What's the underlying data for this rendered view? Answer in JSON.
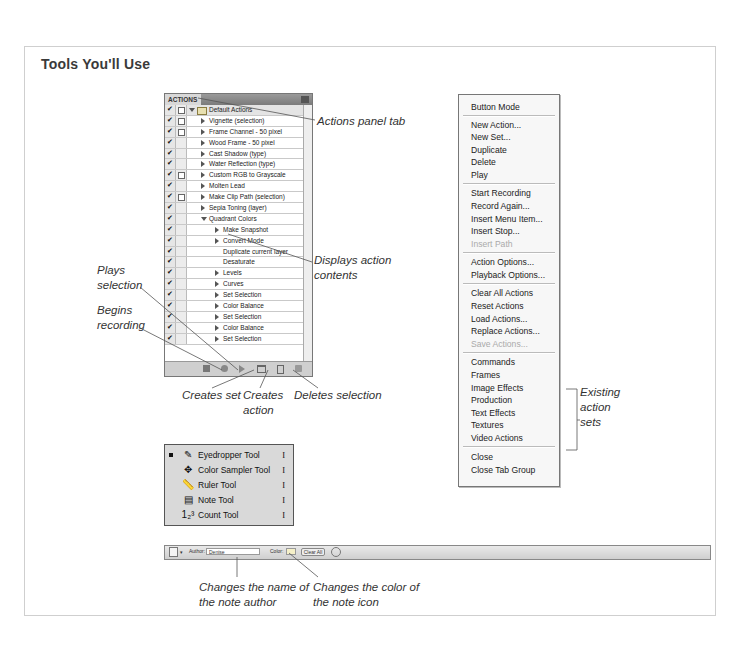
{
  "title": "Tools You'll Use",
  "actions_panel": {
    "tab_label": "ACTIONS",
    "rows": [
      {
        "label": "Default Actions",
        "type": "set",
        "expanded": true,
        "dialog": true
      },
      {
        "label": "Vignette (selection)",
        "type": "action",
        "dialog": true
      },
      {
        "label": "Frame Channel - 50 pixel",
        "type": "action",
        "dialog": true
      },
      {
        "label": "Wood Frame - 50 pixel",
        "type": "action",
        "dialog": false
      },
      {
        "label": "Cast Shadow (type)",
        "type": "action",
        "dialog": false
      },
      {
        "label": "Water Reflection (type)",
        "type": "action",
        "dialog": false
      },
      {
        "label": "Custom RGB to Grayscale",
        "type": "action",
        "dialog": true
      },
      {
        "label": "Molten Lead",
        "type": "action",
        "dialog": false
      },
      {
        "label": "Make Clip Path (selection)",
        "type": "action",
        "dialog": true
      },
      {
        "label": "Sepia Toning (layer)",
        "type": "action",
        "dialog": false
      },
      {
        "label": "Quadrant Colors",
        "type": "action",
        "expanded": true,
        "dialog": false
      },
      {
        "label": "Make Snapshot",
        "type": "step",
        "arrow": true
      },
      {
        "label": "Convert Mode",
        "type": "step",
        "arrow": true
      },
      {
        "label": "Duplicate current layer",
        "type": "step",
        "arrow": false
      },
      {
        "label": "Desaturate",
        "type": "step",
        "arrow": false
      },
      {
        "label": "Levels",
        "type": "step",
        "arrow": true
      },
      {
        "label": "Curves",
        "type": "step",
        "arrow": true
      },
      {
        "label": "Set Selection",
        "type": "step",
        "arrow": true
      },
      {
        "label": "Color Balance",
        "type": "step",
        "arrow": true
      },
      {
        "label": "Set Selection",
        "type": "step",
        "arrow": true
      },
      {
        "label": "Color Balance",
        "type": "step",
        "arrow": true
      },
      {
        "label": "Set Selection",
        "type": "step",
        "arrow": true
      }
    ],
    "footer_buttons": [
      "stop-icon",
      "record-icon",
      "play-icon",
      "new-set-icon",
      "new-action-icon",
      "delete-icon"
    ]
  },
  "callouts": {
    "panel_tab": "Actions panel tab",
    "displays_contents": [
      "Displays action",
      "contents"
    ],
    "plays_selection": [
      "Plays",
      "selection"
    ],
    "begins_recording": [
      "Begins",
      "recording"
    ],
    "creates_set": "Creates set",
    "creates_action": [
      "Creates",
      "action"
    ],
    "deletes_selection": "Deletes selection",
    "existing_sets": [
      "Existing",
      "action",
      "sets"
    ],
    "author_name": [
      "Changes the name of",
      "the note author"
    ],
    "note_color": [
      "Changes the color of",
      "the note icon"
    ]
  },
  "menu": {
    "items": [
      {
        "label": "Button Mode",
        "y": 7
      },
      {
        "sep": true,
        "y": 20
      },
      {
        "label": "New Action...",
        "y": 25
      },
      {
        "label": "New Set...",
        "y": 37
      },
      {
        "label": "Duplicate",
        "y": 50
      },
      {
        "label": "Delete",
        "y": 62
      },
      {
        "label": "Play",
        "y": 75
      },
      {
        "sep": true,
        "y": 88
      },
      {
        "label": "Start Recording",
        "y": 93
      },
      {
        "label": "Record Again...",
        "y": 106
      },
      {
        "label": "Insert Menu Item...",
        "y": 119
      },
      {
        "label": "Insert Stop...",
        "y": 131
      },
      {
        "label": "Insert Path",
        "y": 144,
        "disabled": true
      },
      {
        "sep": true,
        "y": 157
      },
      {
        "label": "Action Options...",
        "y": 162
      },
      {
        "label": "Playback Options...",
        "y": 175
      },
      {
        "sep": true,
        "y": 188
      },
      {
        "label": "Clear All Actions",
        "y": 193
      },
      {
        "label": "Reset Actions",
        "y": 206
      },
      {
        "label": "Load Actions...",
        "y": 219
      },
      {
        "label": "Replace Actions...",
        "y": 231
      },
      {
        "label": "Save Actions...",
        "y": 244,
        "disabled": true
      },
      {
        "sep": true,
        "y": 257
      },
      {
        "label": "Commands",
        "y": 262
      },
      {
        "label": "Frames",
        "y": 275
      },
      {
        "label": "Image Effects",
        "y": 288
      },
      {
        "label": "Production",
        "y": 300
      },
      {
        "label": "Text Effects",
        "y": 313
      },
      {
        "label": "Textures",
        "y": 325
      },
      {
        "label": "Video Actions",
        "y": 338
      },
      {
        "sep": true,
        "y": 351
      },
      {
        "label": "Close",
        "y": 357
      },
      {
        "label": "Close Tab Group",
        "y": 370
      }
    ]
  },
  "tools": [
    {
      "label": "Eyedropper Tool",
      "key": "I",
      "icon": "eyedropper-icon",
      "glyph": "✎",
      "active": true
    },
    {
      "label": "Color Sampler Tool",
      "key": "I",
      "icon": "color-sampler-icon",
      "glyph": "✥"
    },
    {
      "label": "Ruler Tool",
      "key": "I",
      "icon": "ruler-icon",
      "glyph": "📏"
    },
    {
      "label": "Note Tool",
      "key": "I",
      "icon": "note-icon",
      "glyph": "▤"
    },
    {
      "label": "Count Tool",
      "key": "I",
      "icon": "count-icon",
      "glyph": "1₂³"
    }
  ],
  "options_bar": {
    "author_label": "Author:",
    "author_value": "Denise",
    "color_label": "Color:",
    "clear_all": "Clear All"
  },
  "colors": {
    "panel_bg": "#d4d4d4",
    "menu_bg": "#f7f7f7",
    "disabled": "#aaaaaa",
    "leader": "#555555"
  }
}
